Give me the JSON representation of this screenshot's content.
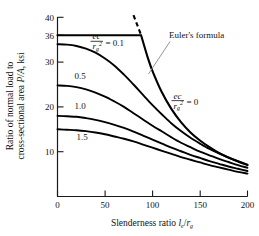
{
  "chart_data": {
    "type": "line",
    "title": "",
    "xlabel": "Slenderness ratio l_e/r_g",
    "ylabel": "Ratio of normal load to cross-sectional area P/A, ksi",
    "xlabel_parts": {
      "lead": "Slenderness ratio ",
      "num": "l",
      "num_sub": "e",
      "slash": "/",
      "den": "r",
      "den_sub": "g"
    },
    "ylabel_line1": "Ratio of normal load to",
    "ylabel_line2": "cross-sectional area P/A, ksi",
    "xlim": [
      0,
      200
    ],
    "ylim": [
      0,
      40
    ],
    "xticks": [
      0,
      50,
      100,
      150,
      200
    ],
    "xtick_labels": [
      "0",
      "50",
      "100",
      "150",
      "200"
    ],
    "yticks": [
      10,
      20,
      30,
      36,
      40
    ],
    "ytick_labels": [
      "10",
      "20",
      "30",
      "36",
      "40"
    ],
    "grid": false,
    "legend": "inline-annotations",
    "units": "ksi",
    "yield_stress": 36,
    "series": [
      {
        "name": "ec/rg^2 = 0",
        "label": "0",
        "x": [
          0,
          88,
          95,
          100,
          110,
          120,
          130,
          140,
          150,
          160,
          170,
          180,
          190,
          200
        ],
        "y": [
          36,
          36,
          31.0,
          28.0,
          23.2,
          19.5,
          16.6,
          14.3,
          12.5,
          11.0,
          9.7,
          8.7,
          7.8,
          7.0
        ]
      },
      {
        "name": "ec/rg^2 = 0.1",
        "label": "0.1",
        "x": [
          0,
          10,
          20,
          30,
          40,
          50,
          60,
          70,
          80,
          90,
          100,
          110,
          120,
          130,
          140,
          150,
          160,
          170,
          180,
          190,
          200
        ],
        "y": [
          34.0,
          33.9,
          33.6,
          33.0,
          32.1,
          30.8,
          29.2,
          27.2,
          25.0,
          22.7,
          20.4,
          18.3,
          16.3,
          14.6,
          13.1,
          11.8,
          10.6,
          9.6,
          8.7,
          7.9,
          7.1
        ]
      },
      {
        "name": "ec/rg^2 = 0.5",
        "label": "0.5",
        "x": [
          0,
          10,
          20,
          30,
          40,
          50,
          60,
          70,
          80,
          90,
          100,
          110,
          120,
          130,
          140,
          150,
          160,
          170,
          180,
          190,
          200
        ],
        "y": [
          24.8,
          24.7,
          24.4,
          23.9,
          23.2,
          22.3,
          21.2,
          20.0,
          18.6,
          17.2,
          15.8,
          14.5,
          13.2,
          12.0,
          11.0,
          10.0,
          9.2,
          8.4,
          7.7,
          7.0,
          6.4
        ]
      },
      {
        "name": "ec/rg^2 = 1.0",
        "label": "1.0",
        "x": [
          0,
          10,
          20,
          30,
          40,
          50,
          60,
          70,
          80,
          90,
          100,
          110,
          120,
          130,
          140,
          150,
          160,
          170,
          180,
          190,
          200
        ],
        "y": [
          18.0,
          17.9,
          17.8,
          17.5,
          17.1,
          16.6,
          16.0,
          15.3,
          14.5,
          13.6,
          12.7,
          11.8,
          10.9,
          10.1,
          9.3,
          8.6,
          7.9,
          7.3,
          6.7,
          6.2,
          5.7
        ]
      },
      {
        "name": "ec/rg^2 = 1.5",
        "label": "1.5",
        "x": [
          0,
          10,
          20,
          30,
          40,
          50,
          60,
          70,
          80,
          90,
          100,
          110,
          120,
          130,
          140,
          150,
          160,
          170,
          180,
          190,
          200
        ],
        "y": [
          15.0,
          14.9,
          14.8,
          14.6,
          14.3,
          13.9,
          13.4,
          12.9,
          12.3,
          11.6,
          10.9,
          10.2,
          9.5,
          8.8,
          8.2,
          7.6,
          7.0,
          6.5,
          6.0,
          5.5,
          5.1
        ]
      }
    ],
    "euler_dashed_segment": {
      "x": [
        80,
        88
      ],
      "y": [
        40.5,
        36.0
      ],
      "note": "Euler's formula extended above yield"
    },
    "annotations": [
      {
        "name": "euler-label",
        "text": "Euler's formula",
        "x": 128,
        "y": 35.5
      },
      {
        "name": "ratio-label-0p1",
        "num": "ec",
        "den": "r",
        "den_sub": "g",
        "den_sup": "2",
        "eq": "= 0.1",
        "x": 40,
        "y": 31.5
      },
      {
        "name": "ratio-label-0",
        "num": "ec",
        "den": "r",
        "den_sub": "g",
        "den_sup": "2",
        "eq": "= 0",
        "x": 150,
        "y": 21.5
      },
      {
        "name": "curve-label-0p5",
        "text": "0.5",
        "x": 22,
        "y": 26.5
      },
      {
        "name": "curve-label-1p0",
        "text": "1.0",
        "x": 22,
        "y": 19.8
      },
      {
        "name": "curve-label-1p5",
        "text": "1.5",
        "x": 24,
        "y": 13.0
      }
    ]
  },
  "labels": {
    "euler_formula": "Euler's formula",
    "curve_0p5": "0.5",
    "curve_1p0": "1.0",
    "curve_1p5": "1.5",
    "eq_0p1": "= 0.1",
    "eq_0": "= 0",
    "frac_num": "ec",
    "frac_den_base": "r",
    "frac_den_sub": "g",
    "frac_den_sup": "2",
    "y_line1": "Ratio of normal load to",
    "y_line2_a": "cross-sectional area ",
    "y_line2_b": "P/A",
    "y_line2_c": ", ksi",
    "x_lead": "Slenderness ratio ",
    "x_num": "l",
    "x_num_sub": "e",
    "x_slash": "/",
    "x_den": "r",
    "x_den_sub": "g",
    "tick_x_0": "0",
    "tick_x_50": "50",
    "tick_x_100": "100",
    "tick_x_150": "150",
    "tick_x_200": "200",
    "tick_y_10": "10",
    "tick_y_20": "20",
    "tick_y_30": "30",
    "tick_y_36": "36",
    "tick_y_40": "40"
  },
  "colors": {
    "curve": "#000000",
    "axis": "#1a1a1a",
    "leader": "#8a8a8a",
    "background": "#ffffff"
  }
}
